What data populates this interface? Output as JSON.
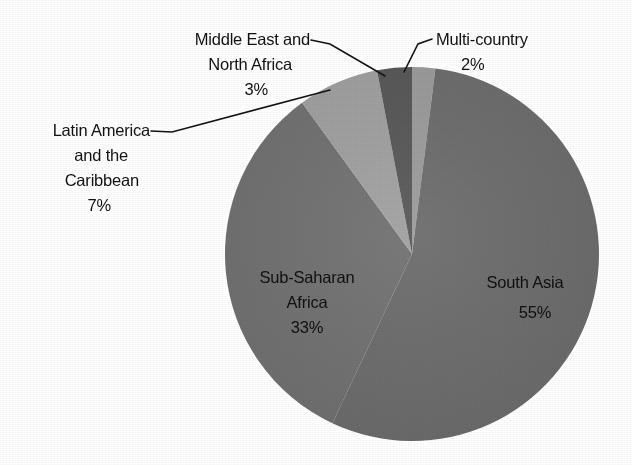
{
  "chart_data": {
    "type": "pie",
    "title": "",
    "subtitle": "",
    "xlabel": "",
    "ylabel": "",
    "legend_position": "none",
    "grid": false,
    "labels_show_percent": true,
    "total_percent": 100,
    "categories": [
      "South Asia",
      "Sub-Saharan Africa",
      "Latin America and the Caribbean",
      "Middle East and North Africa",
      "Multi-country"
    ],
    "values": [
      55,
      33,
      7,
      3,
      2
    ],
    "slices": [
      {
        "name": "multi-country",
        "label": "Multi-country",
        "value_text": "2%",
        "value": 2,
        "color": "#9d9d9d",
        "label_placement": "outside",
        "leader": true
      },
      {
        "name": "south-asia",
        "label": "South Asia",
        "value_text": "55%",
        "value": 55,
        "color": "#6d6d6d",
        "label_placement": "inside",
        "leader": false
      },
      {
        "name": "sub-saharan-africa",
        "label_line1": "Sub-Saharan",
        "label_line2": "Africa",
        "label": "Sub-Saharan Africa",
        "value_text": "33%",
        "value": 33,
        "color": "#727272",
        "label_placement": "inside",
        "leader": false
      },
      {
        "name": "latin-america-caribbean",
        "label_line1": "Latin America",
        "label_line2": "and the",
        "label_line3": "Caribbean",
        "label": "Latin America and the Caribbean",
        "value_text": "7%",
        "value": 7,
        "color": "#a2a2a2",
        "label_placement": "outside",
        "leader": true
      },
      {
        "name": "middle-east-north-africa",
        "label_line1": "Middle East and",
        "label_line2": "North Africa",
        "label": "Middle East and North Africa",
        "value_text": "3%",
        "value": 3,
        "color": "#585858",
        "label_placement": "outside",
        "leader": true
      }
    ]
  },
  "labels": {
    "mena_line1": "Middle East and",
    "mena_line2": "North Africa",
    "mena_value": "3%",
    "multi_country_line1": "Multi-country",
    "multi_country_value": "2%",
    "lac_line1": "Latin America",
    "lac_line2": "and the",
    "lac_line3": "Caribbean",
    "lac_value": "7%",
    "ssa_line1": "Sub-Saharan",
    "ssa_line2": "Africa",
    "ssa_value": "33%",
    "south_asia_line1": "South Asia",
    "south_asia_value": "55%"
  },
  "colors": {
    "background": "#ffffff",
    "text": "#121212",
    "leader_line": "#141414",
    "south_asia": "#6d6d6d",
    "sub_saharan_africa": "#727272",
    "latin_america": "#a2a2a2",
    "middle_east_north_africa": "#585858",
    "multi_country": "#9d9d9d"
  }
}
